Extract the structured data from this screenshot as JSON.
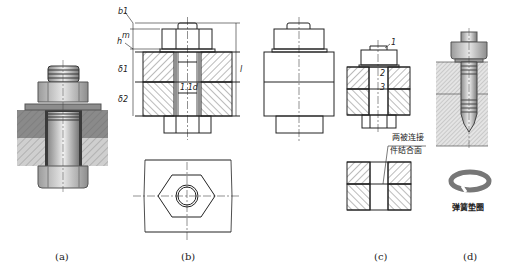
{
  "figure": {
    "panels": [
      {
        "id": "a",
        "caption": "(a)",
        "description": "Shaded pictorial of bolt connection: bolt, nut, washer through two plates"
      },
      {
        "id": "b",
        "caption": "(b)",
        "description": "Sectional and top view of bolt connection with dimensions",
        "dimension_labels": {
          "b1": "b1",
          "m": "m",
          "h": "h",
          "delta1": "δ1",
          "delta2": "δ2",
          "l": "l",
          "hole": "1.1d"
        }
      },
      {
        "id": "b2",
        "caption": "",
        "description": "External front view of bolt connection"
      },
      {
        "id": "c",
        "caption": "(c)",
        "description": "Simplified section with callouts",
        "callouts": [
          "1",
          "2",
          "3"
        ],
        "note_line1": "两被连接",
        "note_line2": "件结合面"
      },
      {
        "id": "d",
        "caption": "(d)",
        "description": "Stud connection with spring washer",
        "washer_label": "弹簧垫圈"
      }
    ]
  },
  "colors": {
    "line": "#222222",
    "hatch": "#555555",
    "metal": "#b8b8b8"
  }
}
